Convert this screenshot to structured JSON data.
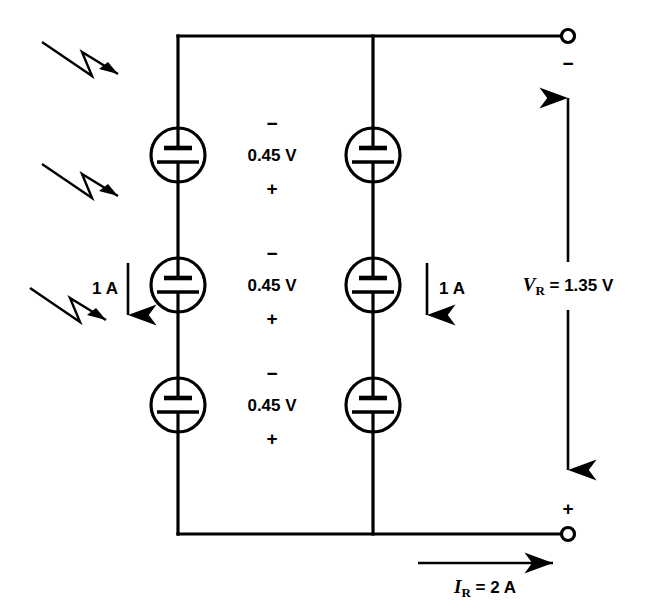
{
  "figure": {
    "background_color": "#ffffff",
    "line_color": "#000000"
  },
  "light_arrows": [
    {
      "name": "light-ray-1",
      "label": "incident-light"
    },
    {
      "name": "light-ray-2",
      "label": "incident-light"
    },
    {
      "name": "light-ray-3",
      "label": "incident-light"
    }
  ],
  "branches": [
    {
      "id": "left-branch",
      "current_label": "1 A",
      "cells": [
        {
          "voltage": "0.45 V",
          "minus": "−",
          "plus": "+"
        },
        {
          "voltage": "0.45 V",
          "minus": "−",
          "plus": "+"
        },
        {
          "voltage": "0.45 V",
          "minus": "−",
          "plus": "+"
        }
      ]
    },
    {
      "id": "right-branch",
      "current_label": "1 A",
      "cells": [
        {
          "voltage": "0.45 V",
          "minus": "−",
          "plus": "+"
        },
        {
          "voltage": "0.45 V",
          "minus": "−",
          "plus": "+"
        },
        {
          "voltage": "0.45 V",
          "minus": "−",
          "plus": "+"
        }
      ]
    }
  ],
  "cell_voltages": [
    "0.45 V",
    "0.45 V",
    "0.45 V"
  ],
  "polarity": {
    "cell_minus": "−",
    "cell_plus": "+",
    "terminal_top": "−",
    "terminal_bottom": "+"
  },
  "output": {
    "voltage_symbol": "V",
    "voltage_subscript": "R",
    "voltage_equals": " = 1.35 V",
    "voltage_full": "V_R = 1.35 V",
    "voltage_value": "1.35 V",
    "current_symbol": "I",
    "current_subscript": "R",
    "current_equals": " = 2 A",
    "current_full": "I_R = 2 A",
    "current_value": "2 A"
  },
  "currents": {
    "left_branch": "1 A",
    "right_branch": "1 A",
    "total": "2 A"
  },
  "terminals": [
    {
      "name": "top-terminal",
      "polarity": "−"
    },
    {
      "name": "bottom-terminal",
      "polarity": "+"
    }
  ]
}
